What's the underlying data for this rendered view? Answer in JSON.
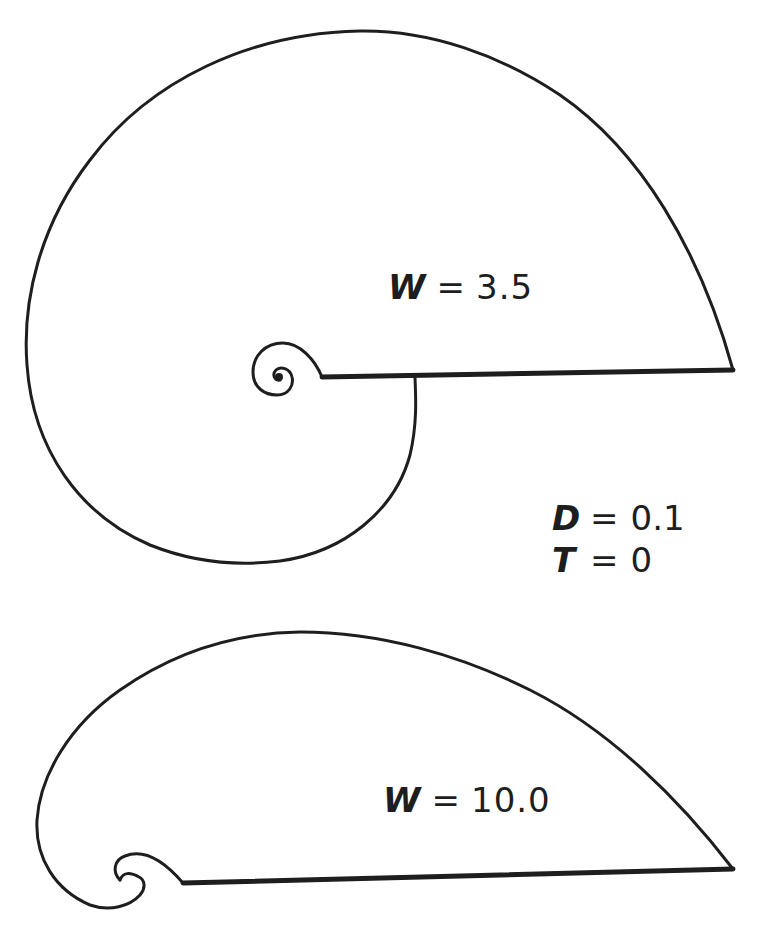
{
  "figure": {
    "stroke_color": "#1e1e1e",
    "background_color": "#ffffff",
    "shells": [
      {
        "name": "upper-shell",
        "label": {
          "variable": "W",
          "equals": "=",
          "value": "3.5"
        }
      },
      {
        "name": "lower-shell",
        "label": {
          "variable": "W",
          "equals": "=",
          "value": "10.0"
        }
      }
    ],
    "shared_parameters": [
      {
        "variable": "D",
        "equals": "=",
        "value": "0.1"
      },
      {
        "variable": "T",
        "equals": "=",
        "value": "0"
      }
    ]
  }
}
